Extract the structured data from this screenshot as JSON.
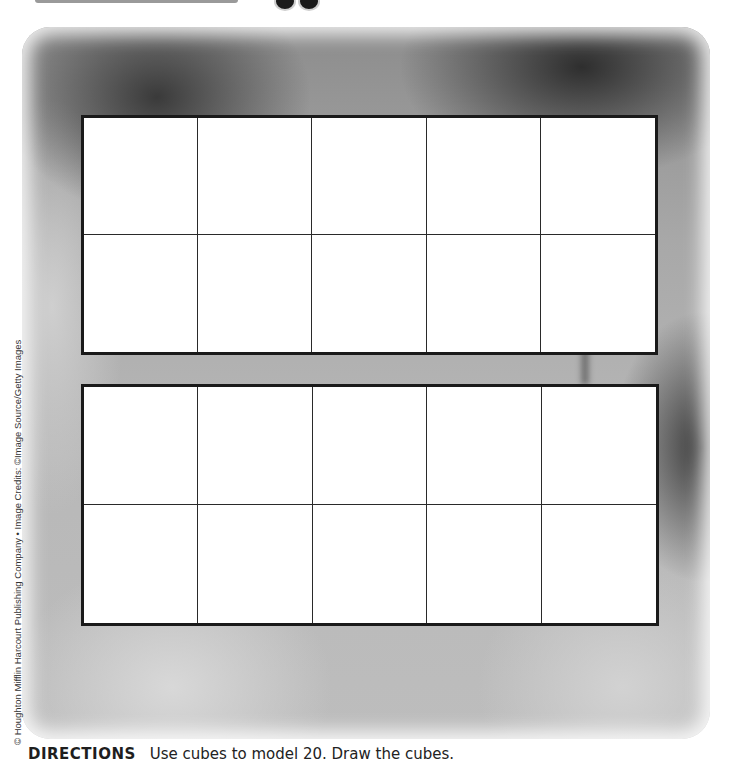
{
  "page": {
    "photo_description": "grayscale close-up of fruit (peaches/mangoes)",
    "credit": "© Houghton Mifflin Harcourt Publishing Company • Image Credits: ©Image Source/Getty Images",
    "directions": {
      "label": "DIRECTIONS",
      "text": "Use cubes to model 20. Draw the cubes."
    },
    "ten_frames": [
      {
        "name": "top",
        "rows": 2,
        "columns": 5,
        "cells": [
          "",
          "",
          "",
          "",
          "",
          "",
          "",
          "",
          "",
          ""
        ]
      },
      {
        "name": "bottom",
        "rows": 2,
        "columns": 5,
        "cells": [
          "",
          "",
          "",
          "",
          "",
          "",
          "",
          "",
          "",
          ""
        ]
      }
    ],
    "colors": {
      "frame_border": "#1a1a1a",
      "cell_fill": "#ffffff",
      "photo_tone": "#a8a8a8"
    }
  }
}
